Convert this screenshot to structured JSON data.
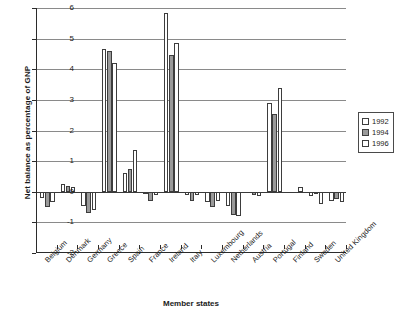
{
  "chart_data": {
    "type": "bar",
    "title": "",
    "xlabel": "Member states",
    "ylabel": "Net balance as percentage of GNP",
    "ylim": [
      -2,
      6
    ],
    "ytick_labels": [
      "6",
      "5",
      "4",
      "3",
      "2",
      "1",
      "0",
      "-1",
      "-2"
    ],
    "ytick_values": [
      6,
      5,
      4,
      3,
      2,
      1,
      0,
      -1,
      -2
    ],
    "grid": true,
    "legend_position": "right",
    "categories": [
      "Belgium",
      "Denmark",
      "Germany",
      "Greece",
      "Spain",
      "France",
      "Ireland",
      "Italy",
      "Luxembourg",
      "Netherlands",
      "Austria",
      "Portugal",
      "Finland",
      "Sweden",
      "United Kingdom"
    ],
    "series": [
      {
        "name": "1992",
        "color": "#ffffff",
        "values": [
          -0.2,
          0.25,
          -0.45,
          4.65,
          0.6,
          -0.05,
          5.85,
          -0.1,
          -0.35,
          -0.45,
          0.0,
          2.9,
          0.0,
          -0.15,
          -0.3
        ]
      },
      {
        "name": "1994",
        "color": "#9a9a9a",
        "values": [
          -0.5,
          0.2,
          -0.7,
          4.6,
          0.75,
          -0.3,
          4.45,
          -0.3,
          -0.5,
          -0.75,
          -0.1,
          2.55,
          0.0,
          -0.05,
          -0.25
        ]
      },
      {
        "name": "1996",
        "color": "#ffffff",
        "values": [
          -0.35,
          0.15,
          -0.6,
          4.2,
          1.35,
          -0.1,
          4.85,
          -0.1,
          -0.3,
          -0.8,
          -0.15,
          3.4,
          0.15,
          -0.4,
          -0.35
        ]
      }
    ]
  },
  "legend": {
    "items": [
      {
        "label": "1992",
        "swatch": "legend-swatch-1992"
      },
      {
        "label": "1994",
        "swatch": "legend-swatch-1994"
      },
      {
        "label": "1996",
        "swatch": "legend-swatch-1996"
      }
    ]
  }
}
